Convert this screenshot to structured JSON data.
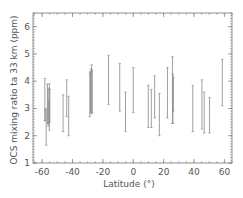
{
  "chart_data": {
    "type": "errorbar",
    "title": "",
    "xlabel": "Latitude (°)",
    "ylabel": "OCS mixing ratio ta 33 km (ppm)",
    "xlim": [
      -66,
      65
    ],
    "ylim": [
      1,
      6.5
    ],
    "xticks": [
      -60,
      -40,
      -20,
      0,
      20,
      40,
      60
    ],
    "yticks": [
      1,
      2,
      3,
      4,
      5,
      6
    ],
    "grid": false,
    "legend": null,
    "colors": {
      "axis": "#777777",
      "bar": "#888888",
      "bar_dense": "#555555"
    },
    "series": [
      {
        "name": "OCS error bars",
        "bars": [
          {
            "lat": -58.2,
            "low": 2.55,
            "high": 4.1
          },
          {
            "lat": -58.0,
            "low": 2.55,
            "high": 2.95
          },
          {
            "lat": -57.3,
            "low": 1.65,
            "high": 3.0
          },
          {
            "lat": -56.5,
            "low": 2.45,
            "high": 3.9
          },
          {
            "lat": -56.0,
            "low": 2.35,
            "high": 3.75
          },
          {
            "lat": -55.6,
            "low": 2.45,
            "high": 3.3
          },
          {
            "lat": -55.2,
            "low": 2.2,
            "high": 3.9
          },
          {
            "lat": -54.9,
            "low": 2.5,
            "high": 3.7
          },
          {
            "lat": -46.2,
            "low": 2.15,
            "high": 3.5
          },
          {
            "lat": -43.8,
            "low": 2.7,
            "high": 4.05
          },
          {
            "lat": -42.5,
            "low": 2.0,
            "high": 3.45
          },
          {
            "lat": -28.6,
            "low": 2.7,
            "high": 4.3
          },
          {
            "lat": -28.2,
            "low": 2.85,
            "high": 4.35
          },
          {
            "lat": -27.8,
            "low": 2.9,
            "high": 4.45
          },
          {
            "lat": -27.4,
            "low": 2.8,
            "high": 4.6
          },
          {
            "lat": -27.0,
            "low": 2.85,
            "high": 4.4
          },
          {
            "lat": -16.3,
            "low": 3.15,
            "high": 4.95
          },
          {
            "lat": -8.9,
            "low": 2.9,
            "high": 4.65
          },
          {
            "lat": -5.1,
            "low": 2.15,
            "high": 3.6
          },
          {
            "lat": 0.0,
            "low": 2.85,
            "high": 4.5
          },
          {
            "lat": 9.9,
            "low": 2.3,
            "high": 3.85
          },
          {
            "lat": 11.9,
            "low": 2.3,
            "high": 3.7
          },
          {
            "lat": 14.1,
            "low": 2.65,
            "high": 4.2
          },
          {
            "lat": 17.2,
            "low": 2.0,
            "high": 3.55
          },
          {
            "lat": 22.5,
            "low": 2.65,
            "high": 4.5
          },
          {
            "lat": 25.8,
            "low": 2.45,
            "high": 4.9
          },
          {
            "lat": 26.1,
            "low": 2.45,
            "high": 4.25
          },
          {
            "lat": 26.4,
            "low": 2.9,
            "high": 4.15
          },
          {
            "lat": 39.2,
            "low": 2.15,
            "high": 3.85
          },
          {
            "lat": 45.2,
            "low": 2.25,
            "high": 4.05
          },
          {
            "lat": 46.7,
            "low": 2.1,
            "high": 3.6
          },
          {
            "lat": 50.2,
            "low": 2.1,
            "high": 3.4
          },
          {
            "lat": 58.6,
            "low": 3.1,
            "high": 4.8
          }
        ]
      }
    ]
  }
}
